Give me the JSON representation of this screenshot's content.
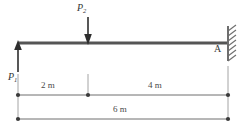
{
  "figure": {
    "type": "beam-free-body-diagram",
    "colors": {
      "beam": "#555555",
      "line": "#6e6e6e",
      "text": "#3a3a3a",
      "hatch": "#6e6e6e",
      "background": "#ffffff"
    },
    "beam": {
      "label": "beam",
      "left_x": 18,
      "right_x": 228,
      "y": 43,
      "thickness": 3
    },
    "support": {
      "name": "fixed-wall-support",
      "point_label": "A",
      "wall_x": 228,
      "wall_top": 26,
      "wall_bottom": 61,
      "hatch_count": 7
    },
    "loads": [
      {
        "name": "load-p1",
        "label": "P",
        "subscript": "1",
        "direction": "up",
        "x": 18,
        "tail_y": 72,
        "head_y": 41
      },
      {
        "name": "load-p2",
        "label": "P",
        "subscript": "2",
        "direction": "down",
        "x": 88,
        "tail_y": 17,
        "head_y": 44
      }
    ],
    "dimensions": [
      {
        "name": "dimension-2m",
        "text": "2 m",
        "from_x": 18,
        "to_x": 88,
        "y": 95
      },
      {
        "name": "dimension-4m",
        "text": "4 m",
        "from_x": 88,
        "to_x": 228,
        "y": 95
      },
      {
        "name": "dimension-6m",
        "text": "6 m",
        "from_x": 18,
        "to_x": 228,
        "y": 119
      }
    ]
  }
}
